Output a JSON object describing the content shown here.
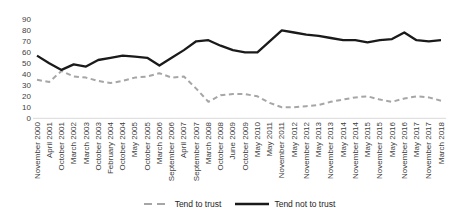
{
  "chart_data": {
    "type": "line",
    "title": "",
    "xlabel": "",
    "ylabel": "",
    "ylim": [
      0,
      90
    ],
    "yticks": [
      0,
      10,
      20,
      30,
      40,
      50,
      60,
      70,
      80,
      90
    ],
    "grid": false,
    "legend_position": "bottom",
    "axis_color": "#d9d9d9",
    "tick_label_color": "#404040",
    "categories": [
      "November 2000",
      "April 2001",
      "October 2001",
      "March 2002",
      "March 2003",
      "October 2003",
      "February 2004",
      "October 2004",
      "May 2005",
      "October 2005",
      "March 2006",
      "September 2006",
      "April 2007",
      "September 2007",
      "March 2008",
      "October 2008",
      "June 2009",
      "October 2009",
      "May 2010",
      "May 2011",
      "November 2011",
      "May 2012",
      "November 2012",
      "May 2013",
      "November 2013",
      "May 2014",
      "November 2014",
      "May 2015",
      "November 2015",
      "May 2016",
      "November 2016",
      "May 2017",
      "November 2017",
      "March 2018"
    ],
    "series": [
      {
        "name": "Tend to trust",
        "style": "dashed",
        "color": "#a6a6a6",
        "values": [
          35,
          33,
          43,
          38,
          37,
          34,
          32,
          34,
          37,
          38,
          41,
          37,
          38,
          27,
          15,
          21,
          22,
          22,
          20,
          14,
          10,
          10,
          11,
          12,
          15,
          17,
          19,
          20,
          17,
          15,
          18,
          20,
          19,
          16
        ]
      },
      {
        "name": "Tend not to trust",
        "style": "solid",
        "color": "#1a1a1a",
        "values": [
          57,
          50,
          44,
          49,
          47,
          53,
          55,
          57,
          56,
          55,
          48,
          55,
          62,
          70,
          71,
          66,
          62,
          60,
          60,
          70,
          80,
          78,
          76,
          75,
          73,
          71,
          71,
          69,
          71,
          72,
          78,
          71,
          70,
          71
        ]
      }
    ]
  }
}
